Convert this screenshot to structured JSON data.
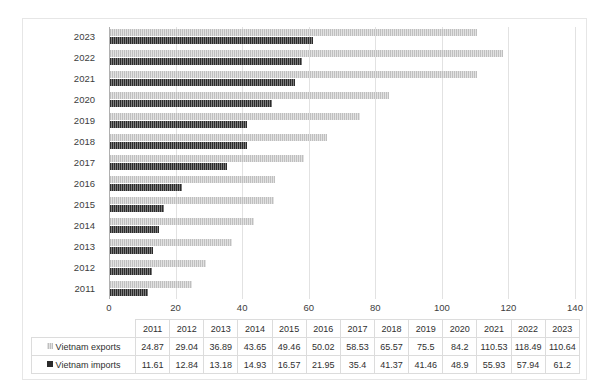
{
  "chart_data": {
    "type": "bar",
    "orientation": "horizontal",
    "title": "",
    "xlabel": "",
    "ylabel": "",
    "xlim": [
      0,
      140
    ],
    "xticks": [
      0,
      20,
      40,
      60,
      80,
      100,
      120,
      140
    ],
    "grid": true,
    "legend_position": "data-table",
    "categories": [
      2011,
      2012,
      2013,
      2014,
      2015,
      2016,
      2017,
      2018,
      2019,
      2020,
      2021,
      2022,
      2023
    ],
    "category_labels": [
      "2011",
      "2012",
      "2013",
      "2014",
      "2015",
      "2016",
      "2017",
      "2018",
      "2019",
      "2020",
      "2021",
      "2022",
      "2023"
    ],
    "series": [
      {
        "name": "Vietnam exports",
        "color": "#bfbfbf",
        "pattern": "vertical-stripes",
        "values": [
          24.87,
          29.04,
          36.89,
          43.65,
          49.46,
          50.02,
          58.53,
          65.57,
          75.5,
          84.2,
          110.53,
          118.49,
          110.64
        ]
      },
      {
        "name": "Vietnam imports",
        "color": "#2b2b2b",
        "pattern": "vertical-stripes",
        "values": [
          11.61,
          12.84,
          13.18,
          14.93,
          16.57,
          21.95,
          35.4,
          41.37,
          41.46,
          48.9,
          55.93,
          57.94,
          61.2
        ]
      }
    ]
  },
  "data_table": {
    "corner_label": "",
    "column_headers": [
      "2011",
      "2012",
      "2013",
      "2014",
      "2015",
      "2016",
      "2017",
      "2018",
      "2019",
      "2020",
      "2021",
      "2022",
      "2023"
    ],
    "rows": [
      {
        "label": "Vietnam exports",
        "swatch": "exports-swatch",
        "cells": [
          "24.87",
          "29.04",
          "36.89",
          "43.65",
          "49.46",
          "50.02",
          "58.53",
          "65.57",
          "75.5",
          "84.2",
          "110.53",
          "118.49",
          "110.64"
        ]
      },
      {
        "label": "Vietnam imports",
        "swatch": "imports-swatch",
        "cells": [
          "11.61",
          "12.84",
          "13.18",
          "14.93",
          "16.57",
          "21.95",
          "35.4",
          "41.37",
          "41.46",
          "48.9",
          "55.93",
          "57.94",
          "61.2"
        ]
      }
    ]
  }
}
